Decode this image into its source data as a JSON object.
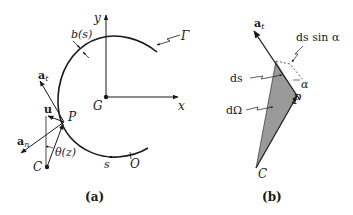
{
  "figure": {
    "panel_a": {
      "caption": "(a)",
      "labels": {
        "y_axis": "y",
        "x_axis": "x",
        "origin": "G",
        "curve": "Γ",
        "width": "b(s)",
        "tangent": "a",
        "tangent_sub": "t",
        "normal": "a",
        "normal_sub": "n",
        "unit": "u",
        "point": "P",
        "center": "C",
        "angle": "θ(z)",
        "arc_length": "s",
        "arc_origin": "O"
      }
    },
    "panel_b": {
      "caption": "(b)",
      "labels": {
        "tangent": "a",
        "tangent_sub": "t",
        "perp_component": "ds sin α",
        "arc_element": "ds",
        "solid_angle": "dΩ",
        "angle": "α",
        "point": "P",
        "center": "C"
      },
      "colors": {
        "wedge_fill": "#9a9a9a"
      }
    }
  }
}
